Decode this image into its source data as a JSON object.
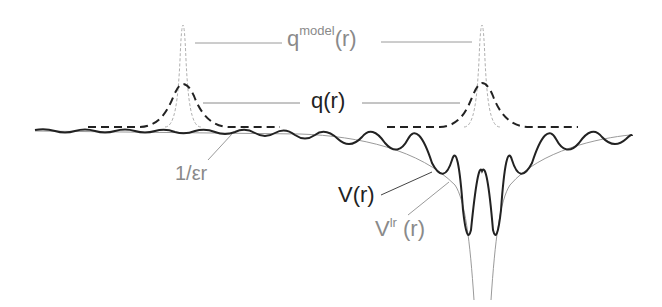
{
  "diagram": {
    "labels": {
      "q_model_base": "q",
      "q_model_sup": "model",
      "q_model_arg": "(r)",
      "q": "q(r)",
      "coulomb": "1/εr",
      "V": "V(r)",
      "V_lr_base": "V",
      "V_lr_sup": "lr",
      "V_lr_arg": " (r)"
    },
    "colors": {
      "dark": "#222222",
      "gray": "#8a8a8a",
      "light": "#b0b0b0"
    },
    "sites_x": [
      183,
      482
    ]
  }
}
